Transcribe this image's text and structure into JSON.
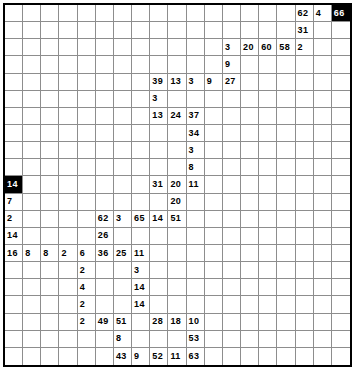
{
  "puzzle": {
    "type": "number-grid-puzzle",
    "columns": 19,
    "rows": 19,
    "grid_color": "#8d8d8d",
    "border_color": "#000000",
    "filled_cell_color": "#000000",
    "filled_cell_text_color": "#ffffff",
    "background_color": "#ffffff",
    "entries": [
      {
        "row": 0,
        "col": 16,
        "value": "62",
        "filled": false
      },
      {
        "row": 0,
        "col": 17,
        "value": "4",
        "filled": false
      },
      {
        "row": 0,
        "col": 18,
        "value": "66",
        "filled": true
      },
      {
        "row": 1,
        "col": 16,
        "value": "31",
        "filled": false
      },
      {
        "row": 2,
        "col": 12,
        "value": "3",
        "filled": false
      },
      {
        "row": 2,
        "col": 13,
        "value": "20",
        "filled": false
      },
      {
        "row": 2,
        "col": 14,
        "value": "60",
        "filled": false
      },
      {
        "row": 2,
        "col": 15,
        "value": "58",
        "filled": false
      },
      {
        "row": 2,
        "col": 16,
        "value": "2",
        "filled": false
      },
      {
        "row": 3,
        "col": 12,
        "value": "9",
        "filled": false
      },
      {
        "row": 4,
        "col": 8,
        "value": "39",
        "filled": false
      },
      {
        "row": 4,
        "col": 9,
        "value": "13",
        "filled": false
      },
      {
        "row": 4,
        "col": 10,
        "value": "3",
        "filled": false
      },
      {
        "row": 4,
        "col": 11,
        "value": "9",
        "filled": false
      },
      {
        "row": 4,
        "col": 12,
        "value": "27",
        "filled": false
      },
      {
        "row": 5,
        "col": 8,
        "value": "3",
        "filled": false
      },
      {
        "row": 6,
        "col": 8,
        "value": "13",
        "filled": false
      },
      {
        "row": 6,
        "col": 9,
        "value": "24",
        "filled": false
      },
      {
        "row": 6,
        "col": 10,
        "value": "37",
        "filled": false
      },
      {
        "row": 7,
        "col": 10,
        "value": "34",
        "filled": false
      },
      {
        "row": 8,
        "col": 10,
        "value": "3",
        "filled": false
      },
      {
        "row": 9,
        "col": 10,
        "value": "8",
        "filled": false
      },
      {
        "row": 10,
        "col": 0,
        "value": "14",
        "filled": true
      },
      {
        "row": 10,
        "col": 8,
        "value": "31",
        "filled": false
      },
      {
        "row": 10,
        "col": 9,
        "value": "20",
        "filled": false
      },
      {
        "row": 10,
        "col": 10,
        "value": "11",
        "filled": false
      },
      {
        "row": 11,
        "col": 0,
        "value": "7",
        "filled": false
      },
      {
        "row": 11,
        "col": 9,
        "value": "20",
        "filled": false
      },
      {
        "row": 12,
        "col": 0,
        "value": "2",
        "filled": false
      },
      {
        "row": 12,
        "col": 5,
        "value": "62",
        "filled": false
      },
      {
        "row": 12,
        "col": 6,
        "value": "3",
        "filled": false
      },
      {
        "row": 12,
        "col": 7,
        "value": "65",
        "filled": false
      },
      {
        "row": 12,
        "col": 8,
        "value": "14",
        "filled": false
      },
      {
        "row": 12,
        "col": 9,
        "value": "51",
        "filled": false
      },
      {
        "row": 13,
        "col": 0,
        "value": "14",
        "filled": false
      },
      {
        "row": 13,
        "col": 5,
        "value": "26",
        "filled": false
      },
      {
        "row": 14,
        "col": 0,
        "value": "16",
        "filled": false
      },
      {
        "row": 14,
        "col": 1,
        "value": "8",
        "filled": false
      },
      {
        "row": 14,
        "col": 2,
        "value": "8",
        "filled": false
      },
      {
        "row": 14,
        "col": 3,
        "value": "2",
        "filled": false
      },
      {
        "row": 14,
        "col": 4,
        "value": "6",
        "filled": false
      },
      {
        "row": 14,
        "col": 5,
        "value": "36",
        "filled": false
      },
      {
        "row": 14,
        "col": 6,
        "value": "25",
        "filled": false
      },
      {
        "row": 14,
        "col": 7,
        "value": "11",
        "filled": false
      },
      {
        "row": 15,
        "col": 4,
        "value": "2",
        "filled": false
      },
      {
        "row": 15,
        "col": 7,
        "value": "3",
        "filled": false
      },
      {
        "row": 16,
        "col": 4,
        "value": "4",
        "filled": false
      },
      {
        "row": 16,
        "col": 7,
        "value": "14",
        "filled": false
      },
      {
        "row": 17,
        "col": 4,
        "value": "2",
        "filled": false
      },
      {
        "row": 17,
        "col": 7,
        "value": "14",
        "filled": false
      },
      {
        "row": 18,
        "col": 4,
        "value": "2",
        "filled": false
      },
      {
        "row": 18,
        "col": 5,
        "value": "49",
        "filled": false
      },
      {
        "row": 18,
        "col": 6,
        "value": "51",
        "filled": false
      },
      {
        "row": 18,
        "col": 8,
        "value": "28",
        "filled": false
      },
      {
        "row": 18,
        "col": 9,
        "value": "18",
        "filled": false
      },
      {
        "row": 18,
        "col": 10,
        "value": "10",
        "filled": false
      },
      {
        "row": 19,
        "col": 6,
        "value": "8",
        "filled": false
      },
      {
        "row": 19,
        "col": 10,
        "value": "53",
        "filled": false
      },
      {
        "row": 20,
        "col": 6,
        "value": "43",
        "filled": false
      },
      {
        "row": 20,
        "col": 7,
        "value": "9",
        "filled": false
      },
      {
        "row": 20,
        "col": 8,
        "value": "52",
        "filled": false
      },
      {
        "row": 20,
        "col": 9,
        "value": "11",
        "filled": false
      },
      {
        "row": 20,
        "col": 10,
        "value": "63",
        "filled": false
      }
    ]
  }
}
